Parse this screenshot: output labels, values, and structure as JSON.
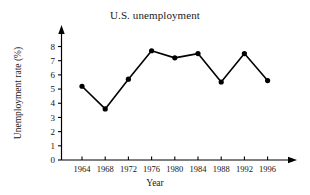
{
  "chart_data": {
    "type": "line",
    "title": "U.S. unemployment",
    "xlabel": "Year",
    "ylabel": "Unemployment rate (%)",
    "categories": [
      "1964",
      "1968",
      "1972",
      "1976",
      "1980",
      "1984",
      "1988",
      "1992",
      "1996"
    ],
    "x": [
      1964,
      1968,
      1972,
      1976,
      1980,
      1984,
      1988,
      1992,
      1996
    ],
    "values": [
      5.2,
      3.6,
      5.7,
      7.7,
      7.2,
      7.5,
      5.5,
      7.5,
      5.6
    ],
    "series": [
      {
        "name": "Unemployment rate",
        "values": [
          5.2,
          3.6,
          5.7,
          7.7,
          7.2,
          7.5,
          5.5,
          7.5,
          5.6
        ]
      }
    ],
    "xlim": [
      1962,
      1998
    ],
    "ylim": [
      0,
      8.6
    ],
    "ytick_labels": [
      "0",
      "1",
      "2",
      "3",
      "4",
      "5",
      "6",
      "7",
      "8"
    ],
    "ytick_values": [
      0,
      1,
      2,
      3,
      4,
      5,
      6,
      7,
      8
    ],
    "xtick_labels": [
      "1964",
      "1968",
      "1972",
      "1976",
      "1980",
      "1984",
      "1988",
      "1992",
      "1996"
    ],
    "grid": false,
    "legend": null,
    "legend_position": "none",
    "marker": "filled-circle",
    "line_color": "#000000",
    "marker_color": "#000000",
    "axis_color": "#000000",
    "background_color": "#ffffff",
    "axis_arrows": true,
    "annotations": []
  },
  "axes": {
    "y_ticks": [
      {
        "label": "0",
        "value": 0
      },
      {
        "label": "1",
        "value": 1
      },
      {
        "label": "2",
        "value": 2
      },
      {
        "label": "3",
        "value": 3
      },
      {
        "label": "4",
        "value": 4
      },
      {
        "label": "5",
        "value": 5
      },
      {
        "label": "6",
        "value": 6
      },
      {
        "label": "7",
        "value": 7
      },
      {
        "label": "8",
        "value": 8
      }
    ],
    "x_ticks": [
      {
        "label": "1964",
        "value": 1964
      },
      {
        "label": "1968",
        "value": 1968
      },
      {
        "label": "1972",
        "value": 1972
      },
      {
        "label": "1976",
        "value": 1976
      },
      {
        "label": "1980",
        "value": 1980
      },
      {
        "label": "1984",
        "value": 1984
      },
      {
        "label": "1988",
        "value": 1988
      },
      {
        "label": "1992",
        "value": 1992
      },
      {
        "label": "1996",
        "value": 1996
      }
    ]
  }
}
